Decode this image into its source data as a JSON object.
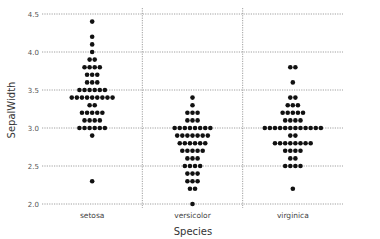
{
  "chart_data": {
    "type": "swarm",
    "title": "",
    "xlabel": "Species",
    "ylabel": "SepalWidth",
    "categories": [
      "setosa",
      "versicolor",
      "virginica"
    ],
    "ylim": [
      2.0,
      4.5
    ],
    "yticks": [
      "2.0",
      "2.5",
      "3.0",
      "3.5",
      "4.0",
      "4.5"
    ],
    "grid": true,
    "legend": null,
    "dot_color": "#111111",
    "series": [
      {
        "name": "setosa",
        "counts": {
          "4.4": 1,
          "4.2": 1,
          "4.1": 1,
          "4.0": 1,
          "3.9": 2,
          "3.8": 4,
          "3.7": 3,
          "3.6": 3,
          "3.5": 6,
          "3.4": 9,
          "3.3": 2,
          "3.2": 5,
          "3.1": 4,
          "3.0": 6,
          "2.9": 1,
          "2.3": 1
        }
      },
      {
        "name": "versicolor",
        "counts": {
          "3.4": 1,
          "3.3": 1,
          "3.2": 3,
          "3.1": 3,
          "3.0": 8,
          "2.9": 7,
          "2.8": 6,
          "2.7": 5,
          "2.6": 3,
          "2.5": 4,
          "2.4": 3,
          "2.3": 3,
          "2.2": 2,
          "2.0": 1
        }
      },
      {
        "name": "virginica",
        "counts": {
          "3.8": 2,
          "3.6": 1,
          "3.4": 2,
          "3.3": 3,
          "3.2": 5,
          "3.1": 4,
          "3.0": 12,
          "2.9": 2,
          "2.8": 8,
          "2.7": 4,
          "2.6": 2,
          "2.5": 4,
          "2.2": 1
        }
      }
    ]
  }
}
